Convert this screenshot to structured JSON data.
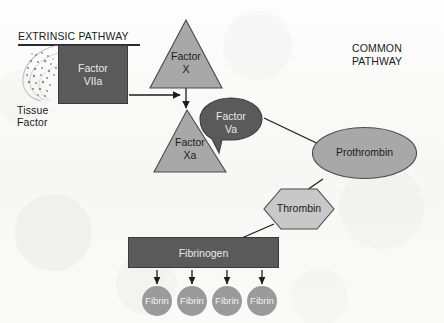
{
  "diagram": {
    "title_extrinsic": "EXTRINSIC PATHWAY",
    "title_common": "COMMON\nPATHWAY",
    "background_color": "#fbfbfa",
    "dark_fill": "#5a5a5a",
    "light_fill": "#a8a8a8",
    "pale_fill": "#c8c8c8",
    "node_fill": "#9a9a9a",
    "stroke_color": "#3a3a3a",
    "text_dark": "#1c1c1c",
    "text_light": "#e9e9e9"
  },
  "labels": {
    "tissue_factor": "Tissue\nFactor"
  },
  "nodes": {
    "factor_viia": {
      "label": "Factor\nVIIa",
      "shape": "rectangle",
      "fill": "#5a5a5a"
    },
    "factor_x": {
      "label": "Factor\nX",
      "shape": "triangle",
      "fill": "#a8a8a8"
    },
    "factor_xa": {
      "label": "Factor\nXa",
      "shape": "triangle",
      "fill": "#a8a8a8"
    },
    "factor_va": {
      "label": "Factor\nVa",
      "shape": "callout",
      "fill": "#5a5a5a"
    },
    "prothrombin": {
      "label": "Prothrombin",
      "shape": "ellipse",
      "fill": "#a8a8a8"
    },
    "thrombin": {
      "label": "Thrombin",
      "shape": "hexagon",
      "fill": "#c8c8c8"
    },
    "fibrinogen": {
      "label": "Fibrinogen",
      "shape": "rectangle",
      "fill": "#5a5a5a"
    }
  },
  "fibrin_nodes": [
    {
      "label": "Fibrin"
    },
    {
      "label": "Fibrin"
    },
    {
      "label": "Fibrin"
    },
    {
      "label": "Fibrin"
    }
  ],
  "icons": {
    "tissue_factor_micrograph": "histology-micrograph-icon"
  }
}
